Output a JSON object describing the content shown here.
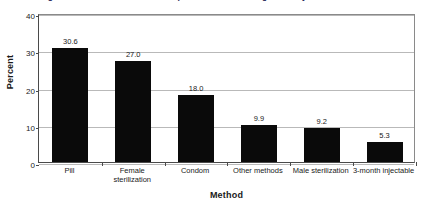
{
  "chart_data": {
    "type": "bar",
    "title": "Figure 1: Current use of contraceptive methods among currently married women",
    "xlabel": "Method",
    "ylabel": "Percent",
    "categories": [
      "Pill",
      "Female sterilization",
      "Condom",
      "Other methods",
      "Male sterilization",
      "3-month injectable"
    ],
    "category_lines": [
      [
        "Pill"
      ],
      [
        "Female",
        "sterilization"
      ],
      [
        "Condom"
      ],
      [
        "Other methods"
      ],
      [
        "Male sterilization"
      ],
      [
        "3-month injectable"
      ]
    ],
    "values": [
      30.6,
      27.0,
      18.0,
      9.9,
      9.2,
      5.3
    ],
    "value_labels": [
      "30.6",
      "27.0",
      "18.0",
      "9.9",
      "9.2",
      "5.3"
    ],
    "ylim": [
      0,
      40
    ],
    "yticks": [
      0,
      10,
      20,
      30,
      40
    ],
    "ytick_labels": [
      "0",
      "10",
      "20",
      "30",
      "40"
    ],
    "grid": true,
    "legend": "none",
    "bar_color": "#0a0a0a",
    "gridline_color": "#b9b9b9",
    "axis_color": "#4a4a4a",
    "background_color": "#ffffff"
  }
}
